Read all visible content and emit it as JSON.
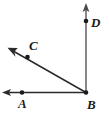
{
  "figure": {
    "type": "geometry-diagram",
    "width": 109,
    "height": 117,
    "background_color": "#ffffff",
    "line_color": "#2b2b2b",
    "vertical_ray_color": "#6b6b6b",
    "point_color": "#1a1a1a",
    "label_color": "#1a1a1a"
  },
  "points": [
    {
      "name": "A",
      "label": "A",
      "x": 22,
      "y": 92,
      "label_x": 18,
      "label_y": 97
    },
    {
      "name": "B",
      "label": "B",
      "x": 86,
      "y": 93,
      "label_x": 87,
      "label_y": 98
    },
    {
      "name": "C",
      "label": "C",
      "x": 27,
      "y": 57,
      "label_x": 29,
      "label_y": 39
    },
    {
      "name": "D",
      "label": "D",
      "x": 86,
      "y": 21,
      "label_x": 91,
      "label_y": 16
    }
  ],
  "rays": [
    {
      "name": "ray-BA",
      "from": "B",
      "through": "A",
      "start_x": 86,
      "start_y": 93,
      "end_x": 4,
      "end_y": 92,
      "arrowhead": true,
      "color": "#2b2b2b"
    },
    {
      "name": "ray-BC",
      "from": "B",
      "through": "C",
      "start_x": 86,
      "start_y": 93,
      "end_x": 9,
      "end_y": 49,
      "arrowhead": true,
      "color": "#2b2b2b"
    },
    {
      "name": "ray-BD",
      "from": "B",
      "through": "D",
      "start_x": 86,
      "start_y": 93,
      "end_x": 86,
      "end_y": 6,
      "arrowhead": true,
      "color": "#6b6b6b"
    }
  ]
}
